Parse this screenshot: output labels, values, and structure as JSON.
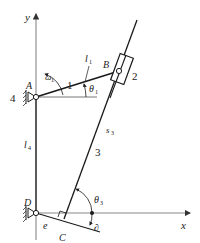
{
  "diagram": {
    "colors": {
      "line": "#1a1a1a",
      "axis": "#888888",
      "background": "#ffffff"
    },
    "axes": {
      "x_label": "x",
      "y_label": "y"
    },
    "points": {
      "A": {
        "label": "A"
      },
      "B": {
        "label": "B"
      },
      "C": {
        "label": "C"
      },
      "D": {
        "label": "D"
      }
    },
    "links": {
      "link1": {
        "number": "1",
        "length_label": "l",
        "length_sub": "1"
      },
      "link2": {
        "number": "2"
      },
      "link3": {
        "number": "3",
        "length_label": "s",
        "length_sub": "3"
      },
      "link4": {
        "number": "4",
        "length_label": "l",
        "length_sub": "4"
      }
    },
    "offset": {
      "label": "e"
    },
    "angles": {
      "theta1": {
        "label": "θ",
        "sub": "1"
      },
      "theta3": {
        "label": "θ",
        "sub": "3"
      },
      "omega1": {
        "label": "ω",
        "sub": "1"
      },
      "delta": {
        "label": "∂"
      }
    }
  }
}
